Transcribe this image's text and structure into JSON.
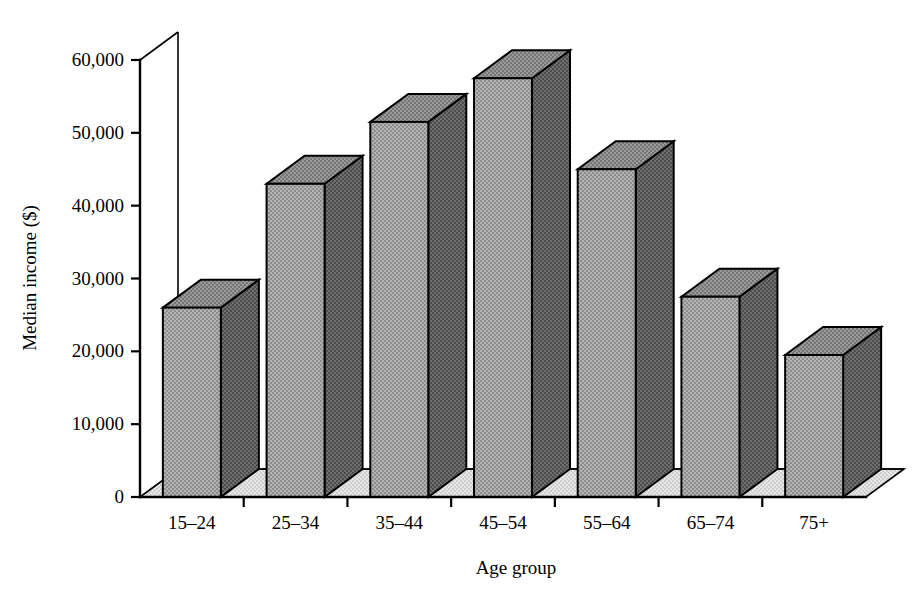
{
  "chart_data": {
    "type": "bar",
    "title": "",
    "subtitle": "",
    "xlabel": "Age group",
    "ylabel": "Median income ($)",
    "categories": [
      "15–24",
      "25–34",
      "35–44",
      "45–54",
      "55–64",
      "65–74",
      "75+"
    ],
    "values": [
      26000,
      43000,
      51500,
      57500,
      45000,
      27500,
      19500
    ],
    "series": [
      {
        "name": "Median income",
        "values": [
          26000,
          43000,
          51500,
          57500,
          45000,
          27500,
          19500
        ]
      }
    ],
    "ylim": [
      0,
      60000
    ],
    "ytick_values": [
      0,
      10000,
      20000,
      30000,
      40000,
      50000,
      60000
    ],
    "ytick_labels": [
      "0",
      "10,000",
      "20,000",
      "30,000",
      "40,000",
      "50,000",
      "60,000"
    ],
    "grid": false,
    "legend": false,
    "legend_position": "none",
    "style": "3d-column",
    "annotations": []
  },
  "axes": {
    "y_title": "Median income ($)",
    "x_title": "Age group"
  },
  "colors": {
    "bar_front": "#a8a8a8",
    "bar_side": "#686868",
    "bar_top": "#8f8f8f",
    "floor": "#dcdcdc",
    "outline": "#000000",
    "background": "#ffffff"
  }
}
